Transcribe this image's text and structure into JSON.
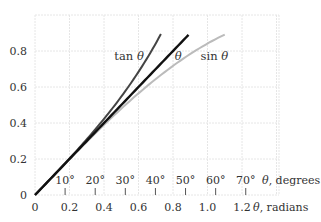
{
  "chart_data": {
    "type": "line",
    "title": "",
    "xlabel": "θ, radians",
    "xlabel_secondary": "θ, degrees",
    "ylabel": "",
    "xlim": [
      0,
      1.42
    ],
    "ylim": [
      0,
      1.0
    ],
    "grid": true,
    "x_ticks": [
      {
        "value": 0,
        "label": "0"
      },
      {
        "value": 0.2,
        "label": "0.2"
      },
      {
        "value": 0.4,
        "label": "0.4"
      },
      {
        "value": 0.6,
        "label": "0.6"
      },
      {
        "value": 0.8,
        "label": "0.8"
      },
      {
        "value": 1.0,
        "label": "1.0"
      },
      {
        "value": 1.2,
        "label": "1.2"
      }
    ],
    "x_ticks_degrees": [
      {
        "value": 10,
        "label": "10°"
      },
      {
        "value": 20,
        "label": "20°"
      },
      {
        "value": 30,
        "label": "30°"
      },
      {
        "value": 40,
        "label": "40°"
      },
      {
        "value": 50,
        "label": "50°"
      },
      {
        "value": 60,
        "label": "60°"
      },
      {
        "value": 70,
        "label": "70°"
      }
    ],
    "y_ticks": [
      {
        "value": 0,
        "label": "0"
      },
      {
        "value": 0.2,
        "label": "0.2"
      },
      {
        "value": 0.4,
        "label": "0.4"
      },
      {
        "value": 0.6,
        "label": "0.6"
      },
      {
        "value": 0.8,
        "label": "0.8"
      }
    ],
    "series": [
      {
        "name": "tan θ",
        "function": "tan",
        "x_end": 0.73,
        "color": "#444444",
        "label_pos": [
          0.46,
          0.77
        ]
      },
      {
        "name": "θ",
        "function": "identity",
        "x_end": 0.89,
        "color": "#111111",
        "label_pos": [
          0.81,
          0.77
        ]
      },
      {
        "name": "sin θ",
        "function": "sin",
        "x_end": 1.1,
        "color": "#bbbbbb",
        "label_pos": [
          0.96,
          0.77
        ]
      }
    ]
  }
}
